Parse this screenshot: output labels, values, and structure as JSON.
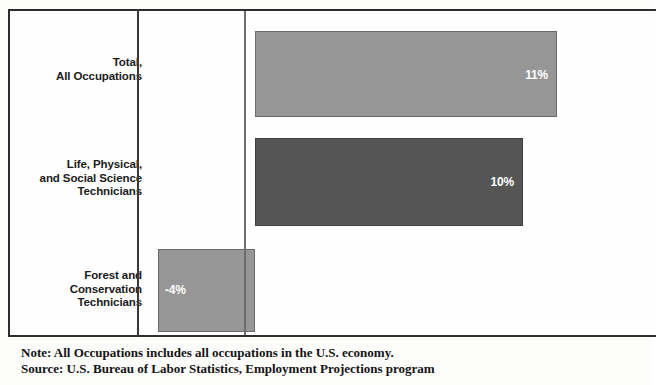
{
  "chart_data": {
    "type": "bar",
    "orientation": "horizontal",
    "title": "",
    "xlabel": "",
    "ylabel": "",
    "categories": [
      "Total,\nAll Occupations",
      "Life, Physical,\nand Social Science\nTechnicians",
      "Forest and\nConservation\nTechnicians"
    ],
    "values": [
      11,
      10,
      -4
    ],
    "value_labels": [
      "11%",
      "10%",
      "-4%"
    ],
    "bar_colors": [
      "#969696",
      "#555555",
      "#979797"
    ],
    "xlim": [
      -5,
      13
    ],
    "grid": false,
    "legend": null,
    "zero_axis": true
  },
  "categories": [
    {
      "line1": "Total,",
      "line2": "All Occupations",
      "line3": ""
    },
    {
      "line1": "Life, Physical,",
      "line2": "and Social Science",
      "line3": "Technicians"
    },
    {
      "line1": "Forest and",
      "line2": "Conservation",
      "line3": "Technicians"
    }
  ],
  "bars": [
    {
      "value_label": "11%"
    },
    {
      "value_label": "10%"
    },
    {
      "value_label": "-4%"
    }
  ],
  "footnotes": {
    "note": "Note: All Occupations includes all occupations in the U.S. economy.",
    "source": "Source: U.S. Bureau of Labor Statistics, Employment Projections program"
  }
}
